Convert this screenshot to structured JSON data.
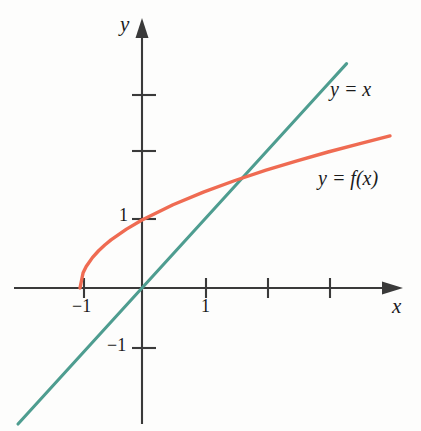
{
  "figure": {
    "background": "#fdfdfc",
    "axis_color": "#3a3a3a",
    "text_color": "#1b1b1b"
  },
  "axes": {
    "x_axis_label": "x",
    "y_axis_label": "y",
    "origin_px": [
      142,
      288
    ],
    "unit_px_x": 62,
    "unit_px_y": 68,
    "x_ticks": [
      {
        "value": -1,
        "label": "−1"
      },
      {
        "value": 1,
        "label": "1"
      },
      {
        "value": 2,
        "label": ""
      },
      {
        "value": 3,
        "label": ""
      }
    ],
    "y_ticks": [
      {
        "value": -1,
        "label": "−1"
      },
      {
        "value": 1,
        "label": "1"
      },
      {
        "value": 2,
        "label": ""
      },
      {
        "value": 3,
        "label": ""
      }
    ]
  },
  "curves": {
    "line": {
      "name": "identity-line",
      "label": "y = x",
      "color": "#4e9d90",
      "equation": "y = x"
    },
    "function": {
      "name": "function-curve",
      "label": "y = f(x)",
      "color": "#ef6b52",
      "equation": "y = sqrt(x + 1)"
    }
  },
  "chart_data": {
    "type": "line",
    "title": "",
    "xlabel": "x",
    "ylabel": "y",
    "xlim": [
      -2.05,
      4.2
    ],
    "ylim": [
      -2.1,
      3.95
    ],
    "grid": false,
    "legend": "inline-annotations",
    "series": [
      {
        "name": "y = x",
        "label": "y = x",
        "color": "#4e9d90",
        "equation": "y = x",
        "x": [
          -2.0,
          -1.5,
          -1.0,
          -0.5,
          0.0,
          0.5,
          1.0,
          1.5,
          2.0,
          2.5,
          3.0,
          3.3
        ],
        "values": [
          -2.0,
          -1.5,
          -1.0,
          -0.5,
          0.0,
          0.5,
          1.0,
          1.5,
          2.0,
          2.5,
          3.0,
          3.3
        ]
      },
      {
        "name": "y = f(x)",
        "label": "y = f(x)",
        "color": "#ef6b52",
        "equation": "y = sqrt(x + 1)",
        "x": [
          -1.0,
          -0.95,
          -0.9,
          -0.8,
          -0.7,
          -0.6,
          -0.5,
          -0.25,
          0.0,
          0.5,
          1.0,
          1.5,
          2.0,
          2.5,
          3.0,
          3.5,
          4.0
        ],
        "values": [
          0.0,
          0.224,
          0.316,
          0.447,
          0.548,
          0.632,
          0.707,
          0.866,
          1.0,
          1.225,
          1.414,
          1.581,
          1.732,
          1.871,
          2.0,
          2.121,
          2.236
        ]
      }
    ],
    "annotations": [
      {
        "text": "y = x",
        "x": 3.0,
        "y": 3.05
      },
      {
        "text": "y = f(x)",
        "x": 2.9,
        "y": 1.75
      }
    ],
    "intersection": {
      "x": 1.618,
      "y": 1.618
    }
  }
}
